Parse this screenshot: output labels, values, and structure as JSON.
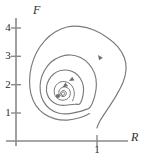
{
  "figure": {
    "kind": "phase-portrait",
    "axis_color": "#808080",
    "curve_color": "#7a7a7a",
    "text_color": "#2b2b2b",
    "xaxis_label": "R",
    "yaxis_label": "F",
    "x_ticks": [
      "1"
    ],
    "y_ticks": [
      "4",
      "3",
      "2",
      "1"
    ]
  },
  "chart_data": {
    "type": "line",
    "title": "",
    "xlabel": "R",
    "ylabel": "F",
    "xlim": [
      0,
      4.6
    ],
    "ylim": [
      0,
      4.9
    ],
    "grid": false,
    "legend": false,
    "xticks": [
      1
    ],
    "yticks": [
      1,
      2,
      3,
      4
    ],
    "equilibrium_point": {
      "R": 1.48,
      "F": 1.59
    },
    "flow_direction": "counterclockwise",
    "arrow_markers": [
      {
        "R": 2.95,
        "F": 2.97,
        "on": "outer-trajectory"
      },
      {
        "R": 1.95,
        "F": 2.16,
        "on": "middle-loop"
      },
      {
        "R": 1.72,
        "F": 1.95,
        "on": "inner-loop"
      }
    ],
    "series": [
      {
        "name": "outer-trajectory",
        "start": {
          "R": 2.86,
          "F": 0.46
        },
        "points": [
          [
            2.86,
            0.46
          ],
          [
            2.96,
            0.7
          ],
          [
            3.22,
            1.1
          ],
          [
            3.55,
            1.62
          ],
          [
            3.8,
            2.12
          ],
          [
            3.89,
            2.55
          ],
          [
            3.83,
            2.94
          ],
          [
            3.6,
            3.33
          ],
          [
            3.22,
            3.66
          ],
          [
            2.75,
            3.92
          ],
          [
            2.25,
            4.05
          ],
          [
            1.8,
            4.03
          ],
          [
            1.38,
            3.85
          ],
          [
            1.01,
            3.54
          ],
          [
            0.72,
            3.12
          ],
          [
            0.54,
            2.62
          ],
          [
            0.48,
            2.12
          ],
          [
            0.53,
            1.66
          ],
          [
            0.7,
            1.26
          ],
          [
            0.99,
            0.96
          ],
          [
            1.38,
            0.78
          ],
          [
            1.82,
            0.74
          ],
          [
            2.25,
            0.82
          ],
          [
            2.6,
            0.97
          ]
        ]
      },
      {
        "name": "middle-loop",
        "points": [
          [
            2.62,
            1.2
          ],
          [
            2.78,
            1.58
          ],
          [
            2.84,
            1.99
          ],
          [
            2.78,
            2.38
          ],
          [
            2.58,
            2.72
          ],
          [
            2.28,
            2.95
          ],
          [
            1.92,
            3.04
          ],
          [
            1.56,
            2.98
          ],
          [
            1.24,
            2.79
          ],
          [
            1.0,
            2.48
          ],
          [
            0.87,
            2.12
          ],
          [
            0.86,
            1.74
          ],
          [
            0.97,
            1.4
          ],
          [
            1.19,
            1.14
          ],
          [
            1.49,
            0.99
          ],
          [
            1.83,
            0.96
          ],
          [
            2.16,
            1.02
          ],
          [
            2.43,
            1.1
          ]
        ]
      },
      {
        "name": "inner-loop",
        "points": [
          [
            2.26,
            1.32
          ],
          [
            2.37,
            1.63
          ],
          [
            2.38,
            1.93
          ],
          [
            2.28,
            2.2
          ],
          [
            2.09,
            2.4
          ],
          [
            1.84,
            2.5
          ],
          [
            1.57,
            2.49
          ],
          [
            1.33,
            2.37
          ],
          [
            1.16,
            2.16
          ],
          [
            1.08,
            1.91
          ],
          [
            1.1,
            1.66
          ],
          [
            1.22,
            1.45
          ],
          [
            1.42,
            1.31
          ],
          [
            1.66,
            1.26
          ],
          [
            1.9,
            1.28
          ],
          [
            2.1,
            1.3
          ]
        ]
      },
      {
        "name": "spiral-core",
        "points": [
          [
            2.0,
            1.42
          ],
          [
            2.06,
            1.63
          ],
          [
            2.03,
            1.85
          ],
          [
            1.91,
            2.02
          ],
          [
            1.73,
            2.1
          ],
          [
            1.55,
            2.08
          ],
          [
            1.41,
            1.96
          ],
          [
            1.35,
            1.79
          ],
          [
            1.38,
            1.61
          ],
          [
            1.49,
            1.49
          ],
          [
            1.63,
            1.44
          ],
          [
            1.78,
            1.47
          ],
          [
            1.88,
            1.55
          ],
          [
            1.92,
            1.68
          ],
          [
            1.89,
            1.81
          ],
          [
            1.8,
            1.89
          ],
          [
            1.69,
            1.91
          ],
          [
            1.58,
            1.86
          ],
          [
            1.52,
            1.77
          ],
          [
            1.52,
            1.67
          ],
          [
            1.58,
            1.6
          ],
          [
            1.66,
            1.57
          ],
          [
            1.74,
            1.6
          ],
          [
            1.78,
            1.67
          ],
          [
            1.76,
            1.74
          ],
          [
            1.7,
            1.78
          ],
          [
            1.63,
            1.77
          ],
          [
            1.58,
            1.72
          ],
          [
            1.58,
            1.66
          ],
          [
            1.62,
            1.62
          ],
          [
            1.68,
            1.62
          ],
          [
            1.72,
            1.66
          ],
          [
            1.71,
            1.71
          ],
          [
            1.66,
            1.73
          ],
          [
            1.61,
            1.7
          ],
          [
            1.6,
            1.65
          ],
          [
            1.64,
            1.62
          ]
        ]
      }
    ]
  }
}
